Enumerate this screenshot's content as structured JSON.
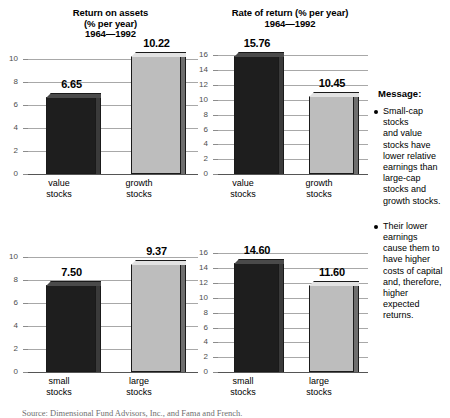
{
  "message": {
    "heading": "Message:",
    "bullets": [
      "Small-cap\nstocks\nand value\nstocks have\nlower relative\nearnings than\nlarge-cap\nstocks and\ngrowth stocks.",
      "Their lower\nearnings\ncause them to\nhave higher\ncosts of capital\nand, therefore,\nhigher\nexpected\nreturns."
    ]
  },
  "source_note": "Source:  Dimensional Fund Advisors, Inc., and Fama and French.",
  "colors": {
    "dark_bar": "#1e1e1e",
    "light_bar": "#bdbdbd",
    "gridline": "#a8a8a8",
    "tick_text": "#4d4d4d"
  },
  "chart_data": [
    {
      "id": "roa-value-growth",
      "type": "bar",
      "title": "Return on assets\n(% per year)\n1964—1992",
      "title_lines": [
        "Return on assets",
        "(% per year)",
        "1964—1992"
      ],
      "categories": [
        "value\nstocks",
        "growth\nstocks"
      ],
      "category_labels": [
        [
          "value",
          "stocks"
        ],
        [
          "growth",
          "stocks"
        ]
      ],
      "values": [
        6.65,
        10.22
      ],
      "value_labels": [
        "6.65",
        "10.22"
      ],
      "bar_styles": [
        "dark",
        "light"
      ],
      "xlabel": "",
      "ylabel": "",
      "ylim": [
        0,
        11
      ],
      "yticks": [
        0,
        2,
        4,
        6,
        8,
        10
      ],
      "ytick_labels": [
        "0",
        "2",
        "4",
        "6",
        "8",
        "10"
      ],
      "grid": true,
      "legend": "none"
    },
    {
      "id": "ror-value-growth",
      "type": "bar",
      "title": "Rate of return (% per year)\n1964—1992",
      "title_lines": [
        "Rate of return (% per year)",
        "1964—1992"
      ],
      "categories": [
        "value\nstocks",
        "growth\nstocks"
      ],
      "category_labels": [
        [
          "value",
          "stocks"
        ],
        [
          "growth",
          "stocks"
        ]
      ],
      "values": [
        15.76,
        10.45
      ],
      "value_labels": [
        "15.76",
        "10.45"
      ],
      "bar_styles": [
        "dark",
        "light"
      ],
      "xlabel": "",
      "ylabel": "",
      "ylim": [
        0,
        17
      ],
      "yticks": [
        0,
        2,
        4,
        6,
        8,
        10,
        12,
        14,
        16
      ],
      "ytick_labels": [
        "0",
        "2",
        "4",
        "6",
        "8",
        "10",
        "12",
        "14",
        "16"
      ],
      "grid": true,
      "legend": "none"
    },
    {
      "id": "roa-small-large",
      "type": "bar",
      "title": "",
      "title_lines": [],
      "categories": [
        "small\nstocks",
        "large\nstocks"
      ],
      "category_labels": [
        [
          "small",
          "stocks"
        ],
        [
          "large",
          "stocks"
        ]
      ],
      "values": [
        7.5,
        9.37
      ],
      "value_labels": [
        "7.50",
        "9.37"
      ],
      "bar_styles": [
        "dark",
        "light"
      ],
      "xlabel": "",
      "ylabel": "",
      "ylim": [
        0,
        11
      ],
      "yticks": [
        0,
        2,
        4,
        6,
        8,
        10
      ],
      "ytick_labels": [
        "0",
        "2",
        "4",
        "6",
        "8",
        "10"
      ],
      "grid": true,
      "legend": "none"
    },
    {
      "id": "ror-small-large",
      "type": "bar",
      "title": "",
      "title_lines": [],
      "categories": [
        "small\nstocks",
        "large\nstocks"
      ],
      "category_labels": [
        [
          "small",
          "stocks"
        ],
        [
          "large",
          "stocks"
        ]
      ],
      "values": [
        14.6,
        11.6
      ],
      "value_labels": [
        "14.60",
        "11.60"
      ],
      "bar_styles": [
        "dark",
        "light"
      ],
      "xlabel": "",
      "ylabel": "",
      "ylim": [
        0,
        17
      ],
      "yticks": [
        0,
        2,
        4,
        6,
        8,
        10,
        12,
        14,
        16
      ],
      "ytick_labels": [
        "0",
        "2",
        "4",
        "6",
        "8",
        "10",
        "12",
        "14",
        "16"
      ],
      "grid": true,
      "legend": "none"
    }
  ]
}
